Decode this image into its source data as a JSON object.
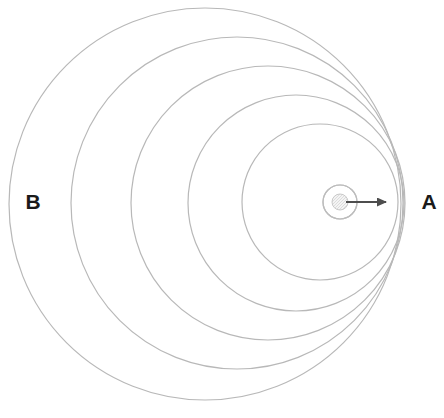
{
  "figure": {
    "kind": "doppler-effect-wavefront-diagram",
    "background_color": "#ffffff",
    "width": 444,
    "height": 418
  },
  "labels": {
    "right": {
      "text": "A",
      "x": 429,
      "y": 203,
      "color": "#1a1a1a",
      "meaning": "compressed-wavefronts-side"
    },
    "left": {
      "text": "B",
      "x": 33,
      "y": 203,
      "color": "#1a1a1a",
      "meaning": "expanded-wavefronts-side"
    }
  },
  "source": {
    "name": "moving-source",
    "center_x": 340,
    "center_y": 202,
    "dot_radius": 8,
    "dot_fill": "#f2f2f2",
    "dot_stroke": "#c9c9c9",
    "ring_radius": 17,
    "ring_stroke": "#bdbdbd"
  },
  "velocity_arrow": {
    "name": "velocity-arrow",
    "x1": 346,
    "y1": 202,
    "x2": 386,
    "y2": 202,
    "color": "#4d4d4d",
    "stroke_width": 2,
    "head_length": 10,
    "head_width": 9,
    "direction": "right"
  },
  "chart_data": {
    "type": "scatter",
    "title": "",
    "xlabel": "",
    "ylabel": "",
    "grid": false,
    "legend": "none",
    "xlim": [
      0,
      444
    ],
    "ylim": [
      0,
      418
    ],
    "wavefront_color": "#b8b8b8",
    "wavefront_stroke_width": 1.2,
    "series": [
      {
        "name": "wavefronts",
        "points": [
          {
            "id": "wavefront-1",
            "cx": 205,
            "cy": 204,
            "r": 196
          },
          {
            "id": "wavefront-2",
            "cx": 237,
            "cy": 203,
            "r": 166
          },
          {
            "id": "wavefront-3",
            "cx": 268,
            "cy": 203,
            "r": 137
          },
          {
            "id": "wavefront-4",
            "cx": 296,
            "cy": 203,
            "r": 108
          },
          {
            "id": "wavefront-5",
            "cx": 320,
            "cy": 202,
            "r": 78
          },
          {
            "id": "wavefront-6",
            "cx": 340,
            "cy": 202,
            "r": 17
          }
        ]
      }
    ]
  }
}
